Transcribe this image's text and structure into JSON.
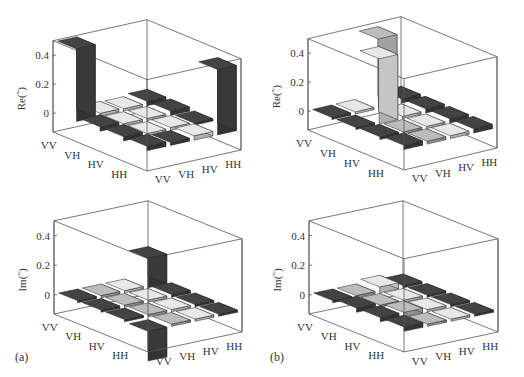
{
  "figure": {
    "panel_labels": [
      "(a)",
      "(b)"
    ]
  },
  "chart_data": [
    {
      "type": "bar3d",
      "panel": "(a)",
      "title": "",
      "zlabel": "Re(˜)",
      "row_labels": [
        "VV",
        "VH",
        "HV",
        "HH"
      ],
      "col_labels": [
        "VV",
        "VH",
        "HV",
        "HH"
      ],
      "zticks": [
        0,
        0.2,
        0.4
      ],
      "zlim": [
        -0.13,
        0.5
      ],
      "values": [
        [
          0.5,
          0.02,
          0.01,
          0.03
        ],
        [
          0.03,
          0.01,
          0.01,
          0.03
        ],
        [
          0.03,
          0.01,
          0.02,
          0.01
        ],
        [
          0.03,
          0.02,
          0.03,
          0.45
        ]
      ],
      "shades": [
        [
          "dark",
          "light",
          "light",
          "dark"
        ],
        [
          "dark",
          "light",
          "light",
          "dark"
        ],
        [
          "dark",
          "light",
          "light",
          "dark"
        ],
        [
          "dark",
          "dark",
          "light",
          "dark"
        ]
      ]
    },
    {
      "type": "bar3d",
      "panel": "(a)",
      "title": "",
      "zlabel": "Im(˜)",
      "row_labels": [
        "VV",
        "VH",
        "HV",
        "HH"
      ],
      "col_labels": [
        "VV",
        "VH",
        "HV",
        "HH"
      ],
      "zticks": [
        0,
        0.2,
        0.4
      ],
      "zlim": [
        -0.13,
        0.5
      ],
      "values": [
        [
          0.0,
          0.01,
          0.01,
          0.2
        ],
        [
          0.01,
          0.01,
          0.01,
          0.02
        ],
        [
          0.01,
          0.01,
          0.01,
          0.0
        ],
        [
          -0.2,
          0.01,
          0.01,
          0.0
        ]
      ],
      "shades": [
        [
          "dark",
          "mid",
          "light",
          "dark"
        ],
        [
          "dark",
          "mid",
          "light",
          "dark"
        ],
        [
          "dark",
          "mid",
          "light",
          "dark"
        ],
        [
          "dark",
          "mid",
          "light",
          "dark"
        ]
      ]
    },
    {
      "type": "bar3d",
      "panel": "(b)",
      "title": "",
      "zlabel": "Re(˜)",
      "row_labels": [
        "VV",
        "VH",
        "HV",
        "HH"
      ],
      "col_labels": [
        "VV",
        "VH",
        "HV",
        "HH"
      ],
      "zticks": [
        0,
        0.2,
        0.4
      ],
      "zlim": [
        -0.13,
        0.5
      ],
      "values": [
        [
          0.0,
          0.01,
          0.48,
          0.03
        ],
        [
          0.01,
          0.45,
          0.01,
          0.03
        ],
        [
          0.02,
          0.0,
          0.01,
          0.03
        ],
        [
          0.03,
          0.02,
          0.02,
          0.03
        ]
      ],
      "shades": [
        [
          "dark",
          "light",
          "mid",
          "dark"
        ],
        [
          "dark",
          "light",
          "light",
          "dark"
        ],
        [
          "dark",
          "mid",
          "light",
          "dark"
        ],
        [
          "dark",
          "mid",
          "light",
          "dark"
        ]
      ]
    },
    {
      "type": "bar3d",
      "panel": "(b)",
      "title": "",
      "zlabel": "Im(˜)",
      "row_labels": [
        "VV",
        "VH",
        "HV",
        "HH"
      ],
      "col_labels": [
        "VV",
        "VH",
        "HV",
        "HH"
      ],
      "zticks": [
        0,
        0.2,
        0.4
      ],
      "zlim": [
        -0.13,
        0.5
      ],
      "values": [
        [
          0.0,
          0.01,
          0.04,
          0.01
        ],
        [
          0.03,
          0.01,
          0.01,
          0.0
        ],
        [
          0.03,
          0.03,
          0.01,
          0.0
        ],
        [
          0.03,
          0.01,
          0.01,
          0.0
        ]
      ],
      "shades": [
        [
          "dark",
          "mid",
          "light",
          "dark"
        ],
        [
          "dark",
          "mid",
          "light",
          "dark"
        ],
        [
          "dark",
          "mid",
          "light",
          "dark"
        ],
        [
          "dark",
          "mid",
          "light",
          "dark"
        ]
      ]
    }
  ],
  "geometry": [
    {
      "left": [
        53,
        132
      ],
      "front": [
        147,
        171
      ],
      "right": [
        241,
        150
      ],
      "z0y_offset": 19,
      "zscale": 145
    },
    {
      "left": [
        54,
        314
      ],
      "front": [
        148,
        352
      ],
      "right": [
        242,
        332
      ],
      "z0y_offset": 19,
      "zscale": 148
    },
    {
      "left": [
        308,
        130
      ],
      "front": [
        404,
        170
      ],
      "right": [
        497,
        148
      ],
      "z0y_offset": 18,
      "zscale": 145
    },
    {
      "left": [
        309,
        314
      ],
      "front": [
        404,
        352
      ],
      "right": [
        498,
        332
      ],
      "z0y_offset": 19,
      "zscale": 148
    }
  ],
  "colors": {
    "dark": "#3c3c3c",
    "mid": "#a9a9a9",
    "light": "#cfcfcf",
    "frame": "#555555"
  }
}
